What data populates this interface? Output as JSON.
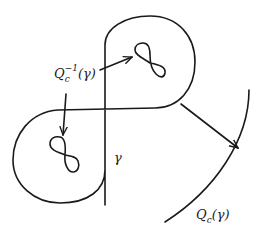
{
  "diagram": {
    "type": "hand-drawn mathematical illustration",
    "labels": {
      "gamma": "γ",
      "preimage": {
        "base": "Q",
        "sub": "c",
        "sup": "−1",
        "arg": "(γ)"
      },
      "image": {
        "base": "Q",
        "sub": "c",
        "arg": "(γ)"
      }
    },
    "elements": [
      "figure-eight curve γ",
      "small figure-eight preimage in upper loop",
      "small figure-eight preimage in lower loop",
      "arc Q_c(γ)",
      "arrow from label to upper preimage",
      "arrow from label to lower preimage",
      "arrow from γ to Q_c(γ)"
    ],
    "colors": {
      "ink": "#1a1a1a",
      "background": "#ffffff"
    }
  }
}
